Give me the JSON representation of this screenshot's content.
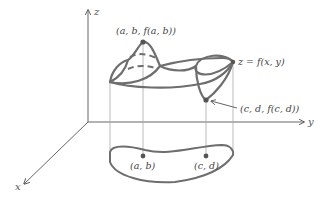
{
  "diagram": {
    "axes": {
      "x": "x",
      "y": "y",
      "z": "z"
    },
    "labels": {
      "max_point": "(a, b, f(a, b))",
      "min_point": "(c, d, f(c, d))",
      "surface": "z = f(x, y)",
      "domain_point_max": "(a, b)",
      "domain_point_min": "(c, d)"
    },
    "colors": {
      "curve": "#6e6e6e",
      "axis": "#555555",
      "guide": "#b0b0b0",
      "text": "#444444"
    }
  }
}
